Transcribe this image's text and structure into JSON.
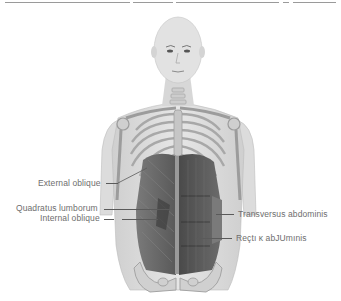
{
  "diagram": {
    "type": "anatomical illustration",
    "palette": {
      "skin": "#d9d9d9",
      "bone": "#c8c8c8",
      "muscle": "#5e5e5e",
      "text": "#6e6e6e",
      "leader": "#5a5a5a"
    }
  },
  "labels": {
    "left": [
      {
        "text": "External oblique"
      },
      {
        "text": "Quadratus lumborum"
      },
      {
        "text": "Internal oblique"
      }
    ],
    "right": [
      {
        "text": "Transversus abdominis"
      },
      {
        "text": "Reçtı ĸ abJUmınis"
      }
    ]
  }
}
